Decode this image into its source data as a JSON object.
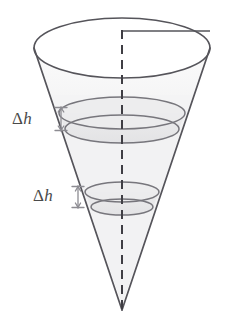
{
  "figure": {
    "name": "inverted-cone-with-riemann-slabs",
    "labels": [
      {
        "id": "upper",
        "delta": "Δ",
        "variable": "h"
      },
      {
        "id": "lower",
        "delta": "Δ",
        "variable": "h"
      }
    ],
    "colors": {
      "outline": "#55545a",
      "ellipse_stroke": "#6e6d73",
      "slab_stroke": "#77767c",
      "axis_dash": "#3f3e44",
      "radius_line": "#55545a",
      "interior_fill": "#f1f1f2",
      "slab_fill": "#e6e6e7",
      "label_text": "#4a4a4a",
      "arrow": "#8d8c92",
      "background": "#ffffff"
    },
    "geometry": {
      "apex": {
        "x": 122,
        "y": 310
      },
      "top_ellipse": {
        "cx": 122,
        "cy": 48,
        "rx": 88,
        "ry": 30
      },
      "axis": {
        "x": 122,
        "y_top": 30,
        "y_bottom": 310
      },
      "radius_segment": {
        "x1": 122,
        "y1": 31,
        "x2": 210,
        "y2": 31
      },
      "slab_upper": {
        "cy_top": 108,
        "cy_bottom": 129,
        "rx_top": 63,
        "ry_top": 16,
        "rx_bottom": 57,
        "ry_bottom": 14
      },
      "slab_lower": {
        "cy_top": 189,
        "cy_bottom": 207,
        "rx_top": 37,
        "ry_top": 10,
        "rx_bottom": 31,
        "ry_bottom": 8
      }
    },
    "dimension_arrows": [
      {
        "id": "upper",
        "x": 61,
        "y_top": 107,
        "y_bottom": 131
      },
      {
        "id": "lower",
        "x": 78,
        "y_top": 186,
        "y_bottom": 208
      }
    ]
  }
}
